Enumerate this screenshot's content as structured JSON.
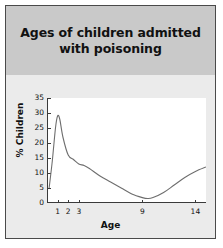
{
  "chart_data": {
    "type": "line",
    "title": "Ages of children admitted with poisoning",
    "xlabel": "Age",
    "ylabel": "% Children",
    "grid": false,
    "legend": null,
    "xlim": [
      0,
      15
    ],
    "ylim": [
      0,
      35
    ],
    "yticks": [
      0,
      5,
      10,
      15,
      20,
      25,
      30,
      35
    ],
    "ytick_labels": [
      "0",
      "5",
      "10",
      "15",
      "20",
      "25",
      "30",
      "35"
    ],
    "xticks": [
      1,
      2,
      3,
      9,
      14
    ],
    "xtick_labels": [
      "1",
      "2",
      "3",
      "9",
      "14"
    ],
    "series": [
      {
        "name": "% Children",
        "x": [
          0.2,
          0.5,
          0.8,
          1.0,
          1.2,
          1.5,
          2.0,
          2.5,
          3.0,
          3.5,
          4.0,
          5.0,
          6.0,
          7.0,
          8.0,
          9.0,
          9.5,
          10.0,
          11.0,
          12.0,
          13.0,
          14.0,
          15.0
        ],
        "values": [
          5,
          14,
          25,
          29,
          28,
          22,
          16,
          14.5,
          13,
          12.5,
          11.5,
          9,
          7,
          5,
          3,
          1.8,
          1.5,
          1.8,
          3.5,
          6,
          8.5,
          10.5,
          12
        ]
      }
    ],
    "annotations": []
  },
  "figure": {
    "title": "Ages of children admitted with poisoning",
    "axis_x_label": "Age",
    "axis_y_label": "% Children",
    "colors": {
      "header_band": "#c9c9c9",
      "body_background": "#ebebeb",
      "plot_background": "#ffffff",
      "curve": "#6e6e6e",
      "axis": "#3a3a3a",
      "border": "#4a4a4a",
      "text": "#111111"
    }
  }
}
